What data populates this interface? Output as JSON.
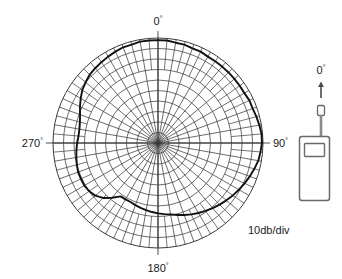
{
  "figure": {
    "title": "",
    "scale_note": "10db/div"
  },
  "polar": {
    "labels": {
      "top": "0",
      "right": "90",
      "bottom": "180",
      "left": "270",
      "degree_symbol": "°"
    },
    "center_x": 158,
    "center_y": 143,
    "outer_radius": 105,
    "ring_count": 10,
    "spoke_step_deg": 10,
    "outer_band_spoke_step_deg": 5,
    "grid_color": "#3b3b3b",
    "curve_color": "#111111"
  },
  "device": {
    "label": "0",
    "degree_symbol": "°",
    "name": "handheld-radio",
    "arrow_direction": "up",
    "body_color": "#ffffff",
    "outline_color": "#555555"
  },
  "chart_data": {
    "type": "line",
    "subtype": "polar",
    "title": "",
    "subtitle": "",
    "xlabel": "Azimuth angle (degrees)",
    "ylabel": "Relative gain",
    "radial_units": "dB",
    "radial_division": 10,
    "radial_division_label": "10db/div",
    "ring_count": 10,
    "angle_origin": "top",
    "angle_direction": "clockwise",
    "axis_tick_labels": [
      "0°",
      "90°",
      "180°",
      "270°"
    ],
    "axis_tick_angles": [
      0,
      90,
      180,
      270
    ],
    "grid": true,
    "legend": null,
    "rlim": [
      0,
      100
    ],
    "r_is_normalized_percent_of_outer_radius": true,
    "angles": [
      0,
      5,
      10,
      15,
      20,
      25,
      30,
      35,
      40,
      45,
      50,
      55,
      60,
      65,
      70,
      75,
      80,
      85,
      90,
      95,
      100,
      105,
      110,
      115,
      120,
      125,
      130,
      135,
      140,
      145,
      150,
      155,
      160,
      165,
      170,
      175,
      180,
      185,
      190,
      195,
      200,
      205,
      210,
      215,
      220,
      225,
      230,
      235,
      240,
      245,
      250,
      255,
      260,
      265,
      270,
      275,
      280,
      285,
      290,
      295,
      300,
      305,
      310,
      315,
      320,
      325,
      330,
      335,
      340,
      345,
      350,
      355
    ],
    "values": [
      98,
      98,
      97,
      97,
      96,
      96,
      95,
      95,
      95,
      95,
      95,
      95,
      95,
      96,
      96,
      97,
      98,
      99,
      99,
      98,
      97,
      95,
      93,
      91,
      89,
      87,
      85,
      83,
      81,
      79,
      77,
      75,
      73,
      71,
      69,
      68,
      67,
      66,
      65,
      64,
      63,
      62,
      62,
      62,
      68,
      74,
      78,
      80,
      81,
      81,
      81,
      80,
      79,
      78,
      77,
      76,
      76,
      77,
      79,
      82,
      85,
      88,
      90,
      92,
      93,
      94,
      95,
      96,
      97,
      97,
      98,
      98
    ],
    "annotations": [
      {
        "text": "10db/div",
        "x_px": 248,
        "y_px": 233
      },
      {
        "text": "0°",
        "x_px": 158,
        "y_px": 22
      },
      {
        "text": "90°",
        "x_px": 272,
        "y_px": 145
      },
      {
        "text": "180°",
        "x_px": 158,
        "y_px": 265
      },
      {
        "text": "270°",
        "x_px": 40,
        "y_px": 145
      }
    ]
  }
}
